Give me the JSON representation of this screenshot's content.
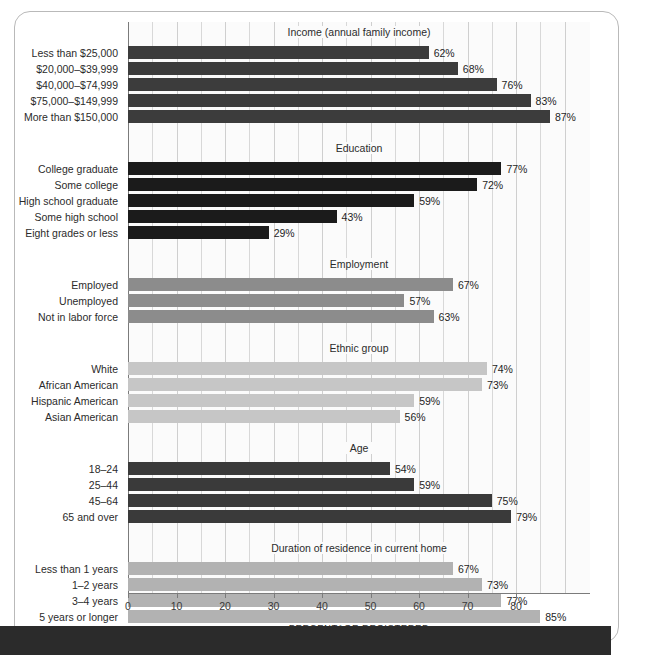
{
  "axis": {
    "x_title": "PERCENTAGE REGISTERED",
    "ticks": [
      0,
      10,
      20,
      30,
      40,
      50,
      60,
      70,
      80
    ]
  },
  "colors": {
    "income": "#3c3c3c",
    "education": "#1b1b1b",
    "employment": "#8c8c8c",
    "ethnic": "#c6c6c6",
    "age": "#3a3a3a",
    "duration": "#b2b2b2",
    "grid": "#d8d8d8",
    "axis": "#7b7b7b",
    "frame": "#b9b9b9",
    "banner": "#2b2b2b",
    "plot_bg": "#fbfbfb"
  },
  "chart_data": {
    "type": "bar",
    "orientation": "horizontal",
    "title": "",
    "xlabel": "PERCENTAGE REGISTERED",
    "ylabel": "",
    "xlim": [
      0,
      95
    ],
    "xticks": [
      0,
      10,
      20,
      30,
      40,
      50,
      60,
      70,
      80
    ],
    "grid": true,
    "grid_axis": "x",
    "legend": "none",
    "value_suffix": "%",
    "groups": [
      {
        "name": "Income (annual family income)",
        "color_key": "income",
        "categories": [
          "Less than $25,000",
          "$20,000–$39,999",
          "$40,000–$74,999",
          "$75,000–$149,999",
          "More than $150,000"
        ],
        "values": [
          62,
          68,
          76,
          83,
          87
        ],
        "labels": [
          "62%",
          "68%",
          "76%",
          "83%",
          "87%"
        ]
      },
      {
        "name": "Education",
        "color_key": "education",
        "categories": [
          "College graduate",
          "Some college",
          "High school graduate",
          "Some high school",
          "Eight grades or less"
        ],
        "values": [
          77,
          72,
          59,
          43,
          29
        ],
        "labels": [
          "77%",
          "72%",
          "59%",
          "43%",
          "29%"
        ]
      },
      {
        "name": "Employment",
        "color_key": "employment",
        "categories": [
          "Employed",
          "Unemployed",
          "Not in labor force"
        ],
        "values": [
          67,
          57,
          63
        ],
        "labels": [
          "67%",
          "57%",
          "63%"
        ]
      },
      {
        "name": "Ethnic group",
        "color_key": "ethnic",
        "categories": [
          "White",
          "African American",
          "Hispanic American",
          "Asian American"
        ],
        "values": [
          74,
          73,
          59,
          56
        ],
        "labels": [
          "74%",
          "73%",
          "59%",
          "56%"
        ]
      },
      {
        "name": "Age",
        "color_key": "age",
        "categories": [
          "18–24",
          "25–44",
          "45–64",
          "65 and over"
        ],
        "values": [
          54,
          59,
          75,
          79
        ],
        "labels": [
          "54%",
          "59%",
          "75%",
          "79%"
        ]
      },
      {
        "name": "Duration of residence in current home",
        "color_key": "duration",
        "categories": [
          "Less than 1 years",
          "1–2 years",
          "3–4 years",
          "5 years or longer"
        ],
        "values": [
          67,
          73,
          77,
          85
        ],
        "labels": [
          "67%",
          "73%",
          "77%",
          "85%"
        ]
      }
    ]
  }
}
